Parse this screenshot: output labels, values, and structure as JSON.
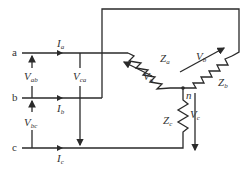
{
  "diagram": {
    "nodes": {
      "a": "a",
      "b": "b",
      "c": "c",
      "n": "n"
    },
    "currents": [
      {
        "symbol": "I",
        "sub": "a"
      },
      {
        "symbol": "I",
        "sub": "b"
      },
      {
        "symbol": "I",
        "sub": "c"
      }
    ],
    "line_voltages": [
      {
        "symbol": "V",
        "sub": "ab"
      },
      {
        "symbol": "V",
        "sub": "bc"
      },
      {
        "symbol": "V",
        "sub": "ca"
      }
    ],
    "phase_voltages": [
      {
        "symbol": "V",
        "sub": "a"
      },
      {
        "symbol": "V",
        "sub": "b"
      },
      {
        "symbol": "V",
        "sub": "c"
      }
    ],
    "impedances": [
      {
        "symbol": "Z",
        "sub": "a"
      },
      {
        "symbol": "Z",
        "sub": "b"
      },
      {
        "symbol": "Z",
        "sub": "c"
      }
    ],
    "colors": {
      "line": "#2a2a2a",
      "text": "#333333",
      "background": "#ffffff"
    }
  }
}
